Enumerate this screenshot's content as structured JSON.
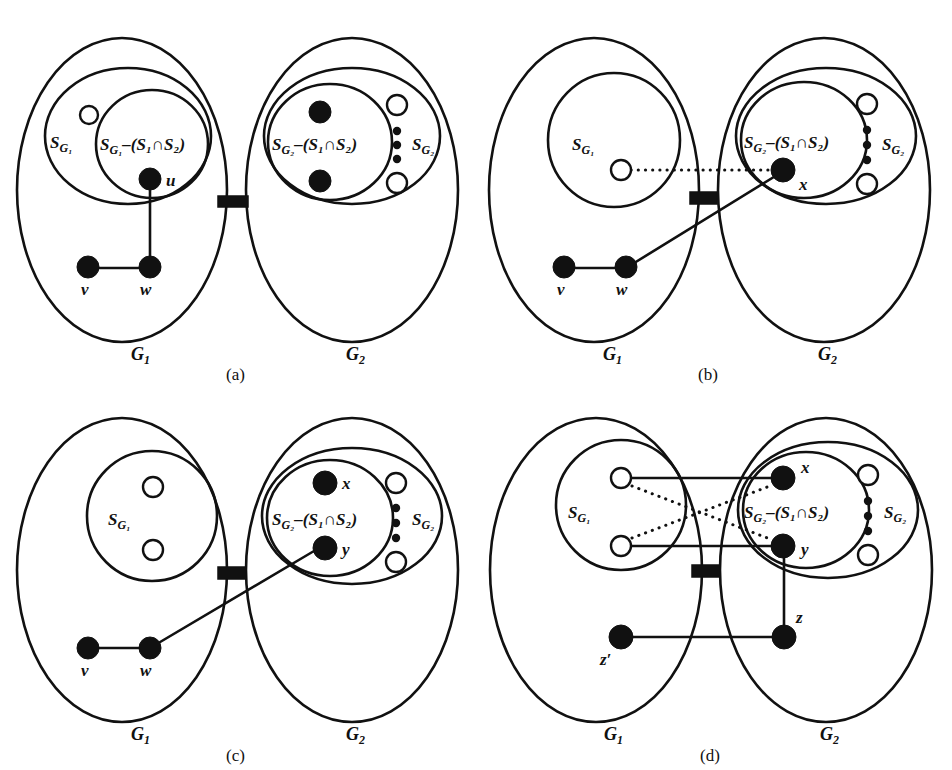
{
  "figure": {
    "background_color": "#ffffff",
    "ink_color": "#111111",
    "panels": [
      {
        "key": "a",
        "caption": "(a)",
        "left_graph_label": "G",
        "left_graph_sub": "1",
        "right_graph_label": "G",
        "right_graph_sub": "2",
        "set_labels": {
          "left_outer": "S",
          "left_outer_sub": "G₁",
          "left_inner": "S",
          "left_inner_sub": "G₁",
          "left_inner_rest": "–(S₁∩S₂)",
          "right_inner": "S",
          "right_inner_sub": "G₂",
          "right_inner_rest": "–(S₁∩S₂)",
          "right_outer": "S",
          "right_outer_sub": "G₂"
        },
        "nodes": [
          {
            "id": "u",
            "label": "u",
            "style": "filled"
          },
          {
            "id": "v",
            "label": "v",
            "style": "filled"
          },
          {
            "id": "w",
            "label": "w",
            "style": "filled"
          }
        ],
        "edges": [
          {
            "from": "u",
            "to": "w",
            "style": "solid"
          },
          {
            "from": "v",
            "to": "w",
            "style": "solid"
          }
        ]
      },
      {
        "key": "b",
        "caption": "(b)",
        "left_graph_label": "G",
        "left_graph_sub": "1",
        "right_graph_label": "G",
        "right_graph_sub": "2",
        "set_labels": {
          "left_inner": "S",
          "left_inner_sub": "G₁",
          "right_inner": "S",
          "right_inner_sub": "G₂",
          "right_inner_rest": "–(S₁∩S₂)",
          "right_outer": "S",
          "right_outer_sub": "G₂"
        },
        "nodes": [
          {
            "id": "x",
            "label": "x",
            "style": "filled"
          },
          {
            "id": "v",
            "label": "v",
            "style": "filled"
          },
          {
            "id": "w",
            "label": "w",
            "style": "filled"
          }
        ],
        "edges": [
          {
            "from": "open-left",
            "to": "x",
            "style": "dotted"
          },
          {
            "from": "w",
            "to": "x",
            "style": "solid"
          },
          {
            "from": "v",
            "to": "w",
            "style": "solid"
          }
        ]
      },
      {
        "key": "c",
        "caption": "(c)",
        "left_graph_label": "G",
        "left_graph_sub": "1",
        "right_graph_label": "G",
        "right_graph_sub": "2",
        "set_labels": {
          "left_inner": "S",
          "left_inner_sub": "G₁",
          "right_inner": "S",
          "right_inner_sub": "G₂",
          "right_inner_rest": "–(S₁∩S₂)",
          "right_outer": "S",
          "right_outer_sub": "G₂"
        },
        "nodes": [
          {
            "id": "x",
            "label": "x",
            "style": "filled"
          },
          {
            "id": "y",
            "label": "y",
            "style": "filled"
          },
          {
            "id": "v",
            "label": "v",
            "style": "filled"
          },
          {
            "id": "w",
            "label": "w",
            "style": "filled"
          }
        ],
        "edges": [
          {
            "from": "w",
            "to": "y",
            "style": "solid"
          },
          {
            "from": "v",
            "to": "w",
            "style": "solid"
          }
        ]
      },
      {
        "key": "d",
        "caption": "(d)",
        "left_graph_label": "G",
        "left_graph_sub": "1",
        "right_graph_label": "G",
        "right_graph_sub": "2",
        "set_labels": {
          "left_inner": "S",
          "left_inner_sub": "G₁",
          "right_inner": "S",
          "right_inner_sub": "G₂",
          "right_inner_rest": "–(S₁∩S₂)",
          "right_outer": "S",
          "right_outer_sub": "G₂"
        },
        "nodes": [
          {
            "id": "x",
            "label": "x",
            "style": "filled"
          },
          {
            "id": "y",
            "label": "y",
            "style": "filled"
          },
          {
            "id": "z",
            "label": "z",
            "style": "filled"
          },
          {
            "id": "zprime",
            "label": "z′",
            "style": "filled"
          }
        ],
        "edges": [
          {
            "from": "open-top-left",
            "to": "x",
            "style": "solid"
          },
          {
            "from": "open-bottom-left",
            "to": "y",
            "style": "solid"
          },
          {
            "from": "open-top-left",
            "to": "y",
            "style": "dotted"
          },
          {
            "from": "open-bottom-left",
            "to": "x",
            "style": "dotted"
          },
          {
            "from": "y",
            "to": "z",
            "style": "solid"
          },
          {
            "from": "zprime",
            "to": "z",
            "style": "solid"
          }
        ]
      }
    ]
  }
}
